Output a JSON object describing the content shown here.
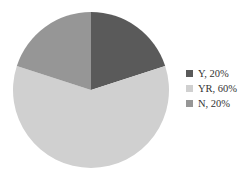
{
  "chart_data": {
    "type": "pie",
    "title": "",
    "categories": [
      "Y",
      "YR",
      "N"
    ],
    "values": [
      20,
      60,
      20
    ],
    "colors": [
      "#5a5a5a",
      "#d0d0d0",
      "#969696"
    ],
    "start_angle_deg": 0,
    "direction": "clockwise",
    "legend": {
      "position": "right",
      "entries": [
        {
          "label": "Y, 20%",
          "color": "#5a5a5a"
        },
        {
          "label": "YR, 60%",
          "color": "#d0d0d0"
        },
        {
          "label": "N, 20%",
          "color": "#969696"
        }
      ]
    }
  }
}
